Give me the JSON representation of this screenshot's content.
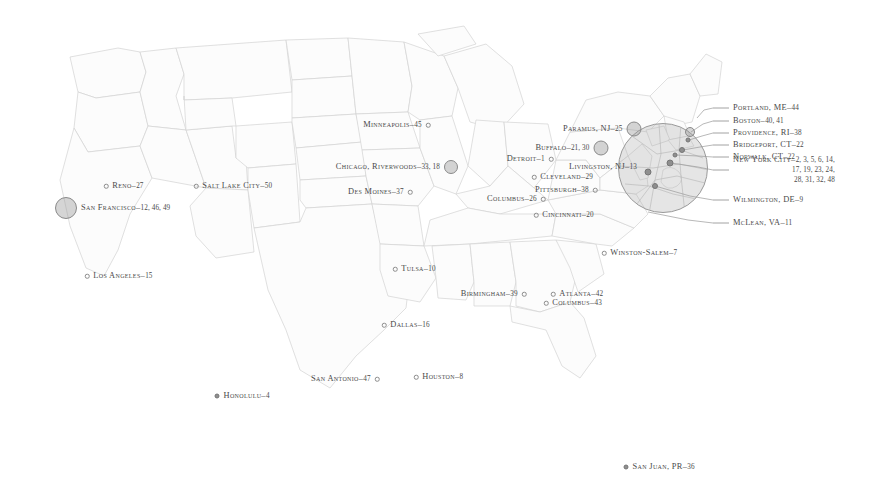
{
  "map": {
    "title": "United States city reference map",
    "region_label": "Northeast detail inset",
    "background_color": "#ffffff",
    "land_fill": "#fbfbfb",
    "border_color": "#cfcfcf",
    "label_color": "#4a4a4a",
    "marker_color": "#8f8f8f",
    "bubble_color": "#969696"
  },
  "cities": [
    {
      "name": "Reno",
      "numbers": "27",
      "x": 106,
      "y": 186,
      "align": "right",
      "marker": "hollow",
      "marker_size": 4.5
    },
    {
      "name": "Salt Lake City",
      "numbers": "50",
      "x": 196,
      "y": 186,
      "align": "right",
      "marker": "hollow",
      "marker_size": 4.5
    },
    {
      "name": "San Francisco",
      "numbers": "12, 46, 49",
      "x": 66,
      "y": 208,
      "align": "right",
      "marker": "bubble",
      "marker_size": 22
    },
    {
      "name": "Los Angeles",
      "numbers": "15",
      "x": 87,
      "y": 276,
      "align": "right",
      "marker": "hollow",
      "marker_size": 4.5
    },
    {
      "name": "Minneapolis",
      "numbers": "45",
      "x": 428,
      "y": 125,
      "align": "left",
      "marker": "hollow",
      "marker_size": 4.5
    },
    {
      "name": "Chicago, Riverwoods",
      "numbers": "33, 18",
      "x": 451,
      "y": 167,
      "align": "left",
      "marker": "bubble",
      "marker_size": 14
    },
    {
      "name": "Des Moines",
      "numbers": "37",
      "x": 410,
      "y": 192,
      "align": "left",
      "marker": "hollow",
      "marker_size": 4.5
    },
    {
      "name": "Detroit",
      "numbers": "1",
      "x": 551,
      "y": 159,
      "align": "left",
      "marker": "hollow",
      "marker_size": 4.5
    },
    {
      "name": "Buffalo",
      "numbers": "21, 30",
      "x": 601,
      "y": 148,
      "align": "left",
      "marker": "bubble",
      "marker_size": 15
    },
    {
      "name": "Cleveland",
      "numbers": "29",
      "x": 534,
      "y": 177,
      "align": "right",
      "marker": "hollow",
      "marker_size": 4.5
    },
    {
      "name": "Pittsburgh",
      "numbers": "38",
      "x": 595,
      "y": 190,
      "align": "left",
      "marker": "hollow",
      "marker_size": 4.5
    },
    {
      "name": "Columbus",
      "numbers": "26",
      "x": 543,
      "y": 199,
      "align": "left",
      "marker": "hollow",
      "marker_size": 4.5
    },
    {
      "name": "Cincinnati",
      "numbers": "20",
      "x": 536,
      "y": 215,
      "align": "right",
      "marker": "hollow",
      "marker_size": 4.5
    },
    {
      "name": "Winston-Salem",
      "numbers": "7",
      "x": 604,
      "y": 253,
      "align": "right",
      "marker": "hollow",
      "marker_size": 4.5
    },
    {
      "name": "Tulsa",
      "numbers": "10",
      "x": 395,
      "y": 269,
      "align": "right",
      "marker": "hollow",
      "marker_size": 4.5
    },
    {
      "name": "Birmingham",
      "numbers": "39",
      "x": 524,
      "y": 294,
      "align": "left",
      "marker": "hollow",
      "marker_size": 4.5
    },
    {
      "name": "Atlanta",
      "numbers": "42",
      "x": 553,
      "y": 294,
      "align": "right",
      "marker": "hollow",
      "marker_size": 4.5
    },
    {
      "name": "Columbus",
      "numbers": "43",
      "x": 546,
      "y": 303,
      "align": "right",
      "marker": "hollow",
      "marker_size": 4.5
    },
    {
      "name": "Dallas",
      "numbers": "16",
      "x": 384,
      "y": 325,
      "align": "right",
      "marker": "hollow",
      "marker_size": 4.5
    },
    {
      "name": "San Antonio",
      "numbers": "47",
      "x": 377,
      "y": 379,
      "align": "left",
      "marker": "hollow",
      "marker_size": 4.5
    },
    {
      "name": "Houston",
      "numbers": "8",
      "x": 416,
      "y": 377,
      "align": "right",
      "marker": "hollow",
      "marker_size": 4.5
    },
    {
      "name": "Honolulu",
      "numbers": "4",
      "x": 217,
      "y": 396,
      "align": "right",
      "marker": "solid",
      "marker_size": 5
    },
    {
      "name": "San Juan, PR",
      "numbers": "36",
      "x": 626,
      "y": 467,
      "align": "right",
      "marker": "solid",
      "marker_size": 5
    },
    {
      "name": "Paramus, NJ",
      "numbers": "25",
      "x": 634,
      "y": 129,
      "align": "left",
      "marker": "bubble",
      "marker_size": 15
    },
    {
      "name": "Livingston, NJ",
      "numbers": "13",
      "x": 641,
      "y": 167,
      "align": "left",
      "marker": "none",
      "marker_size": 0
    }
  ],
  "callouts": {
    "items": [
      {
        "name": "Portland, ME",
        "numbers": "44",
        "extra_lines": [],
        "label_x": 733,
        "label_y": 108,
        "line_x1": 713,
        "line_y1": 108,
        "leader_x": 697,
        "leader_y": 118
      },
      {
        "name": "Boston",
        "numbers": "40, 41",
        "extra_lines": [],
        "label_x": 733,
        "label_y": 121,
        "line_x1": 713,
        "line_y1": 121,
        "leader_x": 691,
        "leader_y": 132
      },
      {
        "name": "Providence, RI",
        "numbers": "38",
        "extra_lines": [],
        "label_x": 733,
        "label_y": 133,
        "line_x1": 713,
        "line_y1": 133,
        "leader_x": 689,
        "leader_y": 140
      },
      {
        "name": "Bridgeport, CT",
        "numbers": "22",
        "extra_lines": [],
        "label_x": 733,
        "label_y": 145,
        "line_x1": 713,
        "line_y1": 145,
        "leader_x": 683,
        "leader_y": 150
      },
      {
        "name": "Norwalk, CT",
        "numbers": "22",
        "extra_lines": [],
        "label_x": 733,
        "label_y": 157,
        "line_x1": 713,
        "line_y1": 157,
        "leader_x": 676,
        "leader_y": 155
      },
      {
        "name": "New York City",
        "numbers": "2, 3, 5, 6, 14,",
        "extra_lines": [
          "17, 19, 23, 24,",
          "28, 31, 32, 48"
        ],
        "label_x": 733,
        "label_y": 170,
        "line_x1": 713,
        "line_y1": 170,
        "leader_x": 671,
        "leader_y": 163
      },
      {
        "name": "Wilmington, DE",
        "numbers": "9",
        "extra_lines": [],
        "label_x": 733,
        "label_y": 200,
        "line_x1": 713,
        "line_y1": 200,
        "leader_x": 655,
        "leader_y": 186
      },
      {
        "name": "McLean, VA",
        "numbers": "11",
        "extra_lines": [],
        "label_x": 733,
        "label_y": 223,
        "line_x1": 713,
        "line_y1": 223,
        "leader_x": 648,
        "leader_y": 212
      }
    ]
  },
  "inset": {
    "center_x": 663,
    "center_y": 168,
    "radius": 45,
    "markers": [
      {
        "x": 690,
        "y": 132,
        "size": 10,
        "type": "bubble"
      },
      {
        "x": 688,
        "y": 140,
        "size": 5,
        "type": "solid"
      },
      {
        "x": 682,
        "y": 150,
        "size": 6,
        "type": "solid"
      },
      {
        "x": 675,
        "y": 155,
        "size": 5,
        "type": "solid"
      },
      {
        "x": 670,
        "y": 163,
        "size": 7,
        "type": "solid"
      },
      {
        "x": 648,
        "y": 172,
        "size": 7,
        "type": "solid"
      },
      {
        "x": 655,
        "y": 186,
        "size": 6,
        "type": "solid"
      }
    ]
  }
}
